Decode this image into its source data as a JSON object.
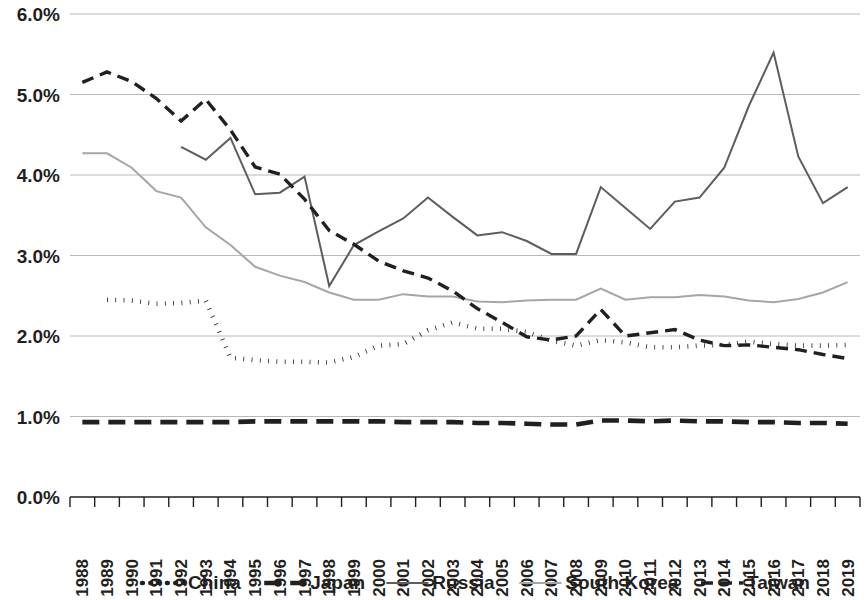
{
  "chart_data": {
    "type": "line",
    "title": "",
    "subtitle": "",
    "xlabel": "",
    "ylabel": "",
    "ylim": [
      0,
      6
    ],
    "ytick_labels": [
      "0.0%",
      "1.0%",
      "2.0%",
      "3.0%",
      "4.0%",
      "5.0%",
      "6.0%"
    ],
    "ytick_values": [
      0,
      1,
      2,
      3,
      4,
      5,
      6
    ],
    "grid": true,
    "legend_position": "bottom",
    "value_unit": "percent of GDP",
    "categories": [
      "1988",
      "1989",
      "1990",
      "1991",
      "1992",
      "1993",
      "1994",
      "1995",
      "1996",
      "1997",
      "1998",
      "1999",
      "2000",
      "2001",
      "2002",
      "2003",
      "2004",
      "2005",
      "2006",
      "2007",
      "2008",
      "2009",
      "2010",
      "2011",
      "2012",
      "2013",
      "2014",
      "2015",
      "2016",
      "2017",
      "2018",
      "2019"
    ],
    "series": [
      {
        "name": "China",
        "color": "#231f20",
        "style": "dotted",
        "values": [
          null,
          2.45,
          2.44,
          2.4,
          2.41,
          2.44,
          1.73,
          1.7,
          1.68,
          1.68,
          1.67,
          1.74,
          1.88,
          1.9,
          2.07,
          2.17,
          2.09,
          2.09,
          2.05,
          1.94,
          1.88,
          1.95,
          1.92,
          1.86,
          1.86,
          1.88,
          1.89,
          1.93,
          1.9,
          1.88,
          1.88,
          1.89
        ]
      },
      {
        "name": "Japan",
        "color": "#231f20",
        "style": "long-dash",
        "values": [
          0.93,
          0.93,
          0.93,
          0.93,
          0.93,
          0.93,
          0.93,
          0.94,
          0.94,
          0.94,
          0.94,
          0.94,
          0.94,
          0.93,
          0.93,
          0.93,
          0.92,
          0.92,
          0.91,
          0.9,
          0.9,
          0.95,
          0.95,
          0.94,
          0.95,
          0.94,
          0.94,
          0.93,
          0.93,
          0.92,
          0.92,
          0.91
        ]
      },
      {
        "name": "Russia",
        "color": "#5d5d5d",
        "style": "solid",
        "values": [
          null,
          null,
          null,
          null,
          4.35,
          4.19,
          4.46,
          3.76,
          3.78,
          3.98,
          2.62,
          3.13,
          3.3,
          3.46,
          3.72,
          3.48,
          3.25,
          3.29,
          3.18,
          3.02,
          3.02,
          3.85,
          3.59,
          3.33,
          3.67,
          3.72,
          4.09,
          4.86,
          5.52,
          4.23,
          3.65,
          3.85
        ]
      },
      {
        "name": "South Korea",
        "color": "#a6a6a6",
        "style": "solid",
        "values": [
          4.27,
          4.27,
          4.09,
          3.8,
          3.72,
          3.35,
          3.13,
          2.86,
          2.75,
          2.67,
          2.54,
          2.45,
          2.45,
          2.52,
          2.49,
          2.49,
          2.43,
          2.42,
          2.44,
          2.45,
          2.45,
          2.59,
          2.45,
          2.48,
          2.48,
          2.51,
          2.49,
          2.44,
          2.42,
          2.46,
          2.54,
          2.67
        ]
      },
      {
        "name": "Taiwan",
        "color": "#231f20",
        "style": "dash",
        "values": [
          5.15,
          5.28,
          5.16,
          4.95,
          4.67,
          4.94,
          4.56,
          4.1,
          4.01,
          3.7,
          3.31,
          3.14,
          2.93,
          2.81,
          2.72,
          2.56,
          2.34,
          2.17,
          1.99,
          1.95,
          2.0,
          2.33,
          2.0,
          2.04,
          2.08,
          1.95,
          1.88,
          1.89,
          1.86,
          1.83,
          1.77,
          1.72
        ]
      }
    ]
  },
  "legend": {
    "entries": [
      {
        "label": "China"
      },
      {
        "label": "Japan"
      },
      {
        "label": "Russia"
      },
      {
        "label": "South Korea"
      },
      {
        "label": "Taiwan"
      }
    ]
  }
}
